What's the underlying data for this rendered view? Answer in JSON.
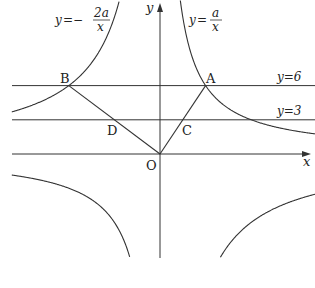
{
  "figure": {
    "axes": {
      "x_label": "x",
      "y_label": "y",
      "origin_label": "O"
    },
    "curves": [
      {
        "name": "curve-a-over-x",
        "label_y": "y",
        "label_eq": "=",
        "label_num": "a",
        "label_den": "x",
        "k": 1
      },
      {
        "name": "curve-neg-2a-over-x",
        "label_y": "y",
        "label_eq": "=−",
        "label_num": "2a",
        "label_den": "x",
        "k": -2
      }
    ],
    "lines": [
      {
        "name": "line-y6",
        "label": "y=6",
        "value": 6
      },
      {
        "name": "line-y3",
        "label": "y=3",
        "value": 3
      }
    ],
    "points": {
      "A": {
        "label": "A",
        "x": 4,
        "y": 6
      },
      "B": {
        "label": "B",
        "x": -8,
        "y": 6
      },
      "C": {
        "label": "C",
        "x": 2,
        "y": 3
      },
      "D": {
        "label": "D",
        "x": -4,
        "y": 3
      },
      "O": {
        "label": "O",
        "x": 0,
        "y": 0
      }
    },
    "params": {
      "a": 24,
      "scale_px_per_unit": 11.4,
      "origin_px": [
        160,
        154
      ]
    },
    "stroke_color": "#333333"
  }
}
